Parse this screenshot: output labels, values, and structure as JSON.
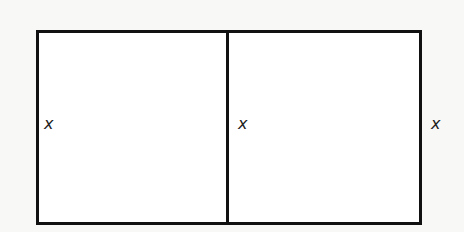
{
  "diagram": {
    "type": "rectangle-divided-into-two",
    "labels": {
      "left_side": "x",
      "middle_divider": "x",
      "right_side": "x"
    },
    "colors": {
      "stroke": "#111111",
      "fill": "#ffffff",
      "background": "#f8f8f6"
    }
  }
}
